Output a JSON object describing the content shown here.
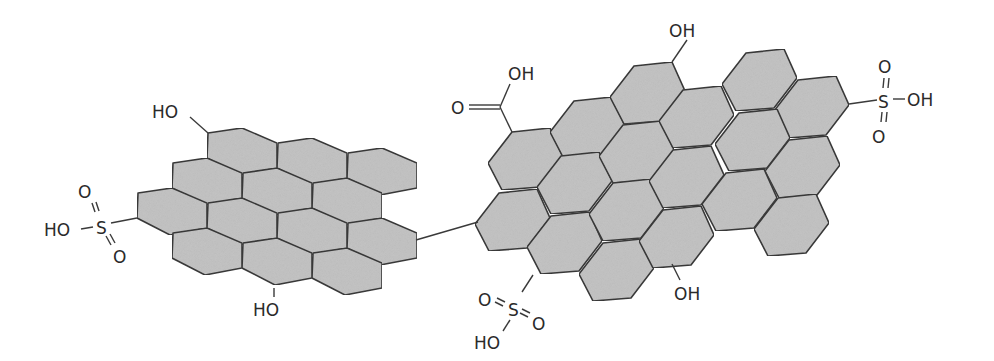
{
  "diagram": {
    "type": "chemical-structure",
    "colors": {
      "hex_fill": "#c4c4c4",
      "stroke": "#3a3a3a",
      "text": "#2a2a2a",
      "background": "#ffffff"
    },
    "left_sheet": {
      "hex_shape": [
        [
          0,
          0
        ],
        [
          34,
          -5
        ],
        [
          69,
          10
        ],
        [
          69,
          35
        ],
        [
          32,
          42
        ],
        [
          -1,
          25
        ]
      ],
      "hexes": [
        [
          208,
          133
        ],
        [
          278,
          143
        ],
        [
          348,
          153
        ],
        [
          173,
          163
        ],
        [
          243,
          173
        ],
        [
          313,
          183
        ],
        [
          138,
          193
        ],
        [
          208,
          203
        ],
        [
          278,
          213
        ],
        [
          348,
          223
        ],
        [
          173,
          233
        ],
        [
          243,
          243
        ],
        [
          313,
          253
        ]
      ],
      "groups": {
        "top_hydroxyl": "HO",
        "bottom_hydroxyl": "HO",
        "sulfonic": {
          "oxygen_top": "O",
          "sulfur": "S",
          "hydroxyl": "HO",
          "oxygen_bottom": "O"
        }
      }
    },
    "right_sheet": {
      "hex_shape": [
        [
          -38,
          4
        ],
        [
          -14,
          -27
        ],
        [
          24,
          -31
        ],
        [
          37,
          -2
        ],
        [
          14,
          28
        ],
        [
          -24,
          31
        ]
      ],
      "hexes": [
        [
          526,
          159
        ],
        [
          588,
          128
        ],
        [
          648,
          93
        ],
        [
          760,
          80
        ],
        [
          812,
          107
        ],
        [
          513,
          220
        ],
        [
          575,
          183
        ],
        [
          637,
          152
        ],
        [
          697,
          117
        ],
        [
          753,
          140
        ],
        [
          803,
          167
        ],
        [
          565,
          243
        ],
        [
          627,
          210
        ],
        [
          687,
          177
        ],
        [
          740,
          200
        ],
        [
          792,
          225
        ],
        [
          617,
          270
        ],
        [
          677,
          237
        ]
      ],
      "groups": {
        "carboxyl": {
          "oxygen": "O",
          "hydroxyl": "OH"
        },
        "top_hydroxyl": "OH",
        "bottom_hydroxyl": "OH",
        "right_sulfonic": {
          "oxygen_top": "O",
          "sulfur": "S",
          "hydroxyl": "OH",
          "oxygen_bottom": "O"
        },
        "bottom_sulfonic": {
          "oxygen_left": "O",
          "sulfur": "S",
          "oxygen_right": "O",
          "hydroxyl": "HO"
        }
      }
    }
  }
}
